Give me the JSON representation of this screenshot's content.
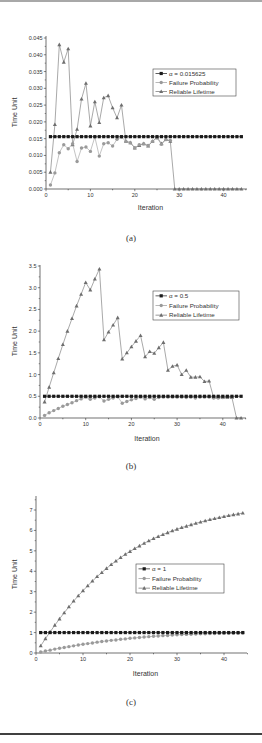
{
  "figure": {
    "captions": [
      "(a)",
      "(b)",
      "(c)"
    ],
    "bottom_text": "Figure caption text (cut off)"
  },
  "colors": {
    "alpha_series": "#1a1a1a",
    "failure_series": "#9a9a9a",
    "lifetime_series": "#6e6e6e",
    "axis": "#333333",
    "legend_border": "#444444"
  },
  "chart_data": [
    {
      "id": "a",
      "type": "line",
      "title": "",
      "xlabel": "Iteration",
      "ylabel": "Time Unit",
      "xlim": [
        0,
        45
      ],
      "ylim": [
        0,
        0.045
      ],
      "xticks": [
        0,
        10,
        20,
        30,
        40
      ],
      "yticks": [
        0.0,
        0.005,
        0.01,
        0.015,
        0.02,
        0.025,
        0.03,
        0.035,
        0.04,
        0.045
      ],
      "ytick_labels": [
        "0.000",
        "0.005",
        "0.010",
        "0.015",
        "0.020",
        "0.025",
        "0.030",
        "0.035",
        "0.040",
        "0.045"
      ],
      "grid": false,
      "legend_position": "upper right",
      "x": [
        1,
        2,
        3,
        4,
        5,
        6,
        7,
        8,
        9,
        10,
        11,
        12,
        13,
        14,
        15,
        16,
        17,
        18,
        19,
        20,
        21,
        22,
        23,
        24,
        25,
        26,
        27,
        28,
        29,
        30,
        31,
        32,
        33,
        34,
        35,
        36,
        37,
        38,
        39,
        40,
        41,
        42,
        43,
        44
      ],
      "series": [
        {
          "name": "α = 0.015625",
          "marker": "square",
          "values": [
            0.0156,
            0.0156,
            0.0156,
            0.0156,
            0.0156,
            0.0156,
            0.0156,
            0.0156,
            0.0156,
            0.0156,
            0.0156,
            0.0156,
            0.0156,
            0.0156,
            0.0156,
            0.0156,
            0.0156,
            0.0156,
            0.0156,
            0.0156,
            0.0156,
            0.0156,
            0.0156,
            0.0156,
            0.0156,
            0.0156,
            0.0156,
            0.0156,
            0.0156,
            0.0156,
            0.0156,
            0.0156,
            0.0156,
            0.0156,
            0.0156,
            0.0156,
            0.0156,
            0.0156,
            0.0156,
            0.0156,
            0.0156,
            0.0156,
            0.0156,
            0.0156
          ]
        },
        {
          "name": "Failure Probability",
          "marker": "circle",
          "values": [
            0.0012,
            0.0048,
            0.0108,
            0.0132,
            0.012,
            0.0135,
            0.0082,
            0.0122,
            0.0125,
            0.0112,
            0.0155,
            0.0098,
            0.0135,
            0.0138,
            0.0128,
            0.0148,
            0.0155,
            0.0142,
            0.0138,
            0.0123,
            0.0132,
            0.0135,
            0.013,
            0.0142,
            0.0152,
            0.0133,
            0.0147,
            0.0145,
            null,
            null,
            null,
            null,
            null,
            null,
            null,
            null,
            null,
            null,
            null,
            null,
            null,
            null,
            null,
            null
          ]
        },
        {
          "name": "Reliable Lifetime",
          "marker": "triangle",
          "values": [
            0.005,
            0.0192,
            0.043,
            0.0378,
            0.0418,
            0.0132,
            0.0178,
            0.0268,
            0.0315,
            0.0188,
            0.026,
            0.0198,
            0.0272,
            0.0278,
            0.0242,
            0.0212,
            0.025,
            0.0142,
            0.0138,
            0.0122,
            0.013,
            0.0135,
            0.0128,
            0.0142,
            0.0155,
            0.0135,
            0.0148,
            0.0142,
            0.0,
            0.0,
            0.0,
            0.0,
            0.0,
            0.0,
            0.0,
            0.0,
            0.0,
            0.0,
            0.0,
            0.0,
            0.0,
            0.0,
            0.0,
            0.0
          ]
        }
      ]
    },
    {
      "id": "b",
      "type": "line",
      "title": "",
      "xlabel": "Iteration",
      "ylabel": "Time Unit",
      "xlim": [
        0,
        45
      ],
      "ylim": [
        0,
        3.7
      ],
      "xticks": [
        0,
        10,
        20,
        30,
        40
      ],
      "yticks": [
        0.0,
        0.5,
        1.0,
        1.5,
        2.0,
        2.5,
        3.0,
        3.5
      ],
      "ytick_labels": [
        "0.0",
        "0.5",
        "1.0",
        "1.5",
        "2.0",
        "2.5",
        "3.0",
        "3.5"
      ],
      "grid": false,
      "legend_position": "upper right",
      "x": [
        1,
        2,
        3,
        4,
        5,
        6,
        7,
        8,
        9,
        10,
        11,
        12,
        13,
        14,
        15,
        16,
        17,
        18,
        19,
        20,
        21,
        22,
        23,
        24,
        25,
        26,
        27,
        28,
        29,
        30,
        31,
        32,
        33,
        34,
        35,
        36,
        37,
        38,
        39,
        40,
        41,
        42,
        43,
        44
      ],
      "series": [
        {
          "name": "α = 0.5",
          "marker": "square",
          "values": [
            0.5,
            0.5,
            0.5,
            0.5,
            0.5,
            0.5,
            0.5,
            0.5,
            0.5,
            0.5,
            0.5,
            0.5,
            0.5,
            0.5,
            0.5,
            0.5,
            0.5,
            0.5,
            0.5,
            0.5,
            0.5,
            0.5,
            0.5,
            0.5,
            0.5,
            0.5,
            0.5,
            0.5,
            0.5,
            0.5,
            0.5,
            0.5,
            0.5,
            0.5,
            0.5,
            0.5,
            0.5,
            0.5,
            0.5,
            0.5,
            0.5,
            0.5,
            0.5,
            0.5
          ]
        },
        {
          "name": "Failure Probability",
          "marker": "circle",
          "values": [
            0.06,
            0.12,
            0.17,
            0.22,
            0.27,
            0.31,
            0.35,
            0.4,
            0.44,
            0.48,
            0.43,
            0.46,
            0.49,
            0.39,
            0.43,
            0.46,
            0.49,
            0.34,
            0.38,
            0.42,
            0.45,
            0.48,
            0.44,
            0.47,
            0.43,
            0.47,
            0.48,
            0.48,
            0.48,
            0.48,
            0.48,
            0.47,
            0.48,
            0.46,
            0.48,
            0.48,
            0.48,
            0.46,
            0.46,
            0.47,
            0.48,
            0.48,
            null,
            null
          ]
        },
        {
          "name": "Reliable Lifetime",
          "marker": "triangle",
          "values": [
            0.37,
            0.71,
            1.04,
            1.37,
            1.69,
            2.0,
            2.29,
            2.58,
            2.85,
            3.12,
            2.95,
            3.2,
            3.43,
            1.8,
            1.98,
            2.14,
            2.31,
            1.36,
            1.5,
            1.64,
            1.77,
            1.9,
            1.41,
            1.53,
            1.49,
            1.62,
            1.74,
            1.1,
            1.19,
            1.22,
            1.0,
            1.1,
            0.94,
            0.94,
            0.95,
            0.84,
            0.85,
            0.47,
            0.47,
            0.47,
            0.47,
            0.47,
            0.0,
            0.0
          ]
        }
      ]
    },
    {
      "id": "c",
      "type": "line",
      "title": "",
      "xlabel": "Iteration",
      "ylabel": "Time Unit",
      "xlim": [
        0,
        45
      ],
      "ylim": [
        0,
        7.3
      ],
      "xticks": [
        0,
        10,
        20,
        30,
        40
      ],
      "yticks": [
        0,
        1,
        2,
        3,
        4,
        5,
        6,
        7
      ],
      "ytick_labels": [
        "0",
        "1",
        "2",
        "3",
        "4",
        "5",
        "6",
        "7"
      ],
      "grid": false,
      "legend_position": "center right",
      "x": [
        1,
        2,
        3,
        4,
        5,
        6,
        7,
        8,
        9,
        10,
        11,
        12,
        13,
        14,
        15,
        16,
        17,
        18,
        19,
        20,
        21,
        22,
        23,
        24,
        25,
        26,
        27,
        28,
        29,
        30,
        31,
        32,
        33,
        34,
        35,
        36,
        37,
        38,
        39,
        40,
        41,
        42,
        43,
        44
      ],
      "series": [
        {
          "name": "α = 1",
          "marker": "square",
          "values": [
            1,
            1,
            1,
            1,
            1,
            1,
            1,
            1,
            1,
            1,
            1,
            1,
            1,
            1,
            1,
            1,
            1,
            1,
            1,
            1,
            1,
            1,
            1,
            1,
            1,
            1,
            1,
            1,
            1,
            1,
            1,
            1,
            1,
            1,
            1,
            1,
            1,
            1,
            1,
            1,
            1,
            1,
            1,
            1
          ]
        },
        {
          "name": "Failure Probability",
          "marker": "circle",
          "values": [
            0.05,
            0.1,
            0.14,
            0.19,
            0.23,
            0.27,
            0.31,
            0.35,
            0.39,
            0.43,
            0.46,
            0.49,
            0.53,
            0.56,
            0.59,
            0.62,
            0.64,
            0.67,
            0.69,
            0.72,
            0.74,
            0.76,
            0.78,
            0.8,
            0.82,
            0.83,
            0.85,
            0.86,
            0.88,
            0.89,
            0.9,
            0.91,
            0.92,
            0.93,
            0.94,
            0.94,
            0.95,
            0.95,
            0.96,
            0.96,
            0.97,
            0.97,
            0.97,
            0.98
          ]
        },
        {
          "name": "Reliable Lifetime",
          "marker": "triangle",
          "values": [
            0.35,
            0.7,
            1.03,
            1.36,
            1.67,
            1.97,
            2.26,
            2.54,
            2.8,
            3.05,
            3.29,
            3.52,
            3.74,
            3.94,
            4.14,
            4.33,
            4.5,
            4.67,
            4.83,
            4.97,
            5.11,
            5.24,
            5.37,
            5.49,
            5.6,
            5.7,
            5.8,
            5.89,
            5.98,
            6.06,
            6.14,
            6.21,
            6.28,
            6.35,
            6.41,
            6.47,
            6.53,
            6.58,
            6.63,
            6.68,
            6.73,
            6.77,
            6.81,
            6.85
          ]
        }
      ]
    }
  ]
}
